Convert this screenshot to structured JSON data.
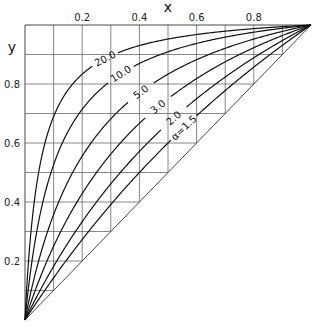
{
  "chart_data": {
    "type": "line",
    "title": "",
    "xlabel": "x",
    "ylabel": "y",
    "xlim": [
      0,
      1
    ],
    "ylim": [
      0,
      1
    ],
    "grid": true,
    "grid_step": 0.1,
    "grid_clipped_above_diagonal": true,
    "x_ticks": [
      0.2,
      0.4,
      0.6,
      0.8
    ],
    "x_tick_labels": [
      "0.2",
      "0.4",
      "0.6",
      "0.8"
    ],
    "y_ticks": [
      0.2,
      0.4,
      0.6,
      0.8
    ],
    "y_tick_labels": [
      "0.2",
      "0.4",
      "0.6",
      "0.8"
    ],
    "x_axis_position": "top",
    "equation": "y = αx / (1 + (α − 1)x)",
    "diagonal": {
      "from": [
        0,
        0
      ],
      "to": [
        1,
        1
      ]
    },
    "series": [
      {
        "name": "20.0",
        "alpha": 20.0,
        "label": "20.0",
        "label_x": 0.28
      },
      {
        "name": "10.0",
        "alpha": 10.0,
        "label": "10.0",
        "label_x": 0.335
      },
      {
        "name": "5.0",
        "alpha": 5.0,
        "label": "5.0",
        "label_x": 0.405
      },
      {
        "name": "3.0",
        "alpha": 3.0,
        "label": "3.0",
        "label_x": 0.465
      },
      {
        "name": "2.0",
        "alpha": 2.0,
        "label": "2.0",
        "label_x": 0.52
      },
      {
        "name": "1.5",
        "alpha": 1.5,
        "label": "α=1.5",
        "label_x": 0.555
      }
    ],
    "sample_points": {
      "x": [
        0.0,
        0.1,
        0.2,
        0.3,
        0.4,
        0.5,
        0.6,
        0.7,
        0.8,
        0.9,
        1.0
      ],
      "alpha_20": [
        0.0,
        0.69,
        0.833,
        0.896,
        0.93,
        0.952,
        0.968,
        0.979,
        0.988,
        0.994,
        1.0
      ],
      "alpha_10": [
        0.0,
        0.526,
        0.714,
        0.811,
        0.87,
        0.909,
        0.938,
        0.959,
        0.976,
        0.989,
        1.0
      ],
      "alpha_5": [
        0.0,
        0.357,
        0.556,
        0.682,
        0.769,
        0.833,
        0.882,
        0.921,
        0.952,
        0.978,
        1.0
      ],
      "alpha_3": [
        0.0,
        0.25,
        0.429,
        0.562,
        0.667,
        0.75,
        0.818,
        0.875,
        0.923,
        0.964,
        1.0
      ],
      "alpha_2": [
        0.0,
        0.182,
        0.333,
        0.462,
        0.571,
        0.667,
        0.75,
        0.824,
        0.889,
        0.947,
        1.0
      ],
      "alpha_1.5": [
        0.0,
        0.143,
        0.273,
        0.391,
        0.5,
        0.6,
        0.692,
        0.778,
        0.857,
        0.931,
        1.0
      ]
    }
  },
  "colors": {
    "curve": "#111111",
    "grid": "#555555",
    "background": "#ffffff"
  }
}
